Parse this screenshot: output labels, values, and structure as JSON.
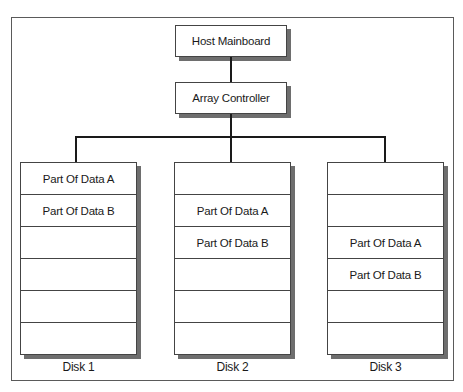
{
  "diagram": {
    "host": {
      "label": "Host Mainboard"
    },
    "controller": {
      "label": "Array Controller"
    },
    "disks": [
      {
        "label": "Disk 1",
        "rows": [
          "Part Of Data A",
          "Part Of Data B",
          "",
          "",
          "",
          ""
        ]
      },
      {
        "label": "Disk 2",
        "rows": [
          "",
          "Part Of Data A",
          "Part Of Data B",
          "",
          "",
          ""
        ]
      },
      {
        "label": "Disk 3",
        "rows": [
          "",
          "",
          "Part Of Data A",
          "Part Of Data B",
          "",
          ""
        ]
      }
    ]
  },
  "colors": {
    "line": "#1a1a1a",
    "shadow": "#6e6e6e",
    "border": "#444444"
  }
}
